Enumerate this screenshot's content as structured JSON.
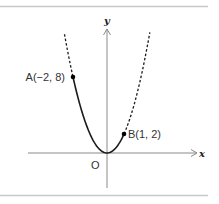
{
  "figure": {
    "function": "y = 2x^2",
    "solid_domain": [
      -2,
      1
    ],
    "dashed_extension": true,
    "axis_labels": {
      "x": "x",
      "y": "y"
    },
    "origin_label": "O",
    "points": [
      {
        "name": "A",
        "x": -2,
        "y": 8,
        "label": "A(−2,  8)"
      },
      {
        "name": "B",
        "x": 1,
        "y": 2,
        "label": "B(1,  2)"
      }
    ],
    "colors": {
      "curve": "#1a1a1a",
      "axis": "#8a8a8a",
      "border": "#c8c8c8"
    }
  }
}
